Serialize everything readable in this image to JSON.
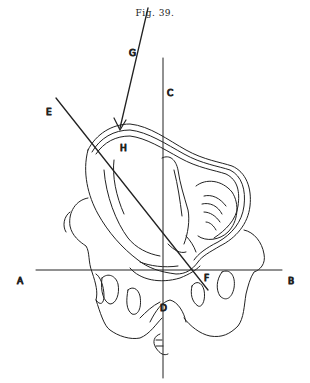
{
  "figure": {
    "title": "Fig. 39.",
    "labels": {
      "A": "A",
      "B": "B",
      "C": "C",
      "D": "D",
      "E": "E",
      "F": "F",
      "G": "G",
      "H": "H"
    },
    "lines": [
      {
        "name": "A-B",
        "description": "horizontal axis line"
      },
      {
        "name": "C-D",
        "description": "vertical axis line"
      },
      {
        "name": "E-F",
        "description": "oblique line through uterus"
      },
      {
        "name": "G-H",
        "description": "arrow pointing to uterus fundus"
      }
    ],
    "ink_color": "#222222",
    "background_color": "#ffffff"
  }
}
